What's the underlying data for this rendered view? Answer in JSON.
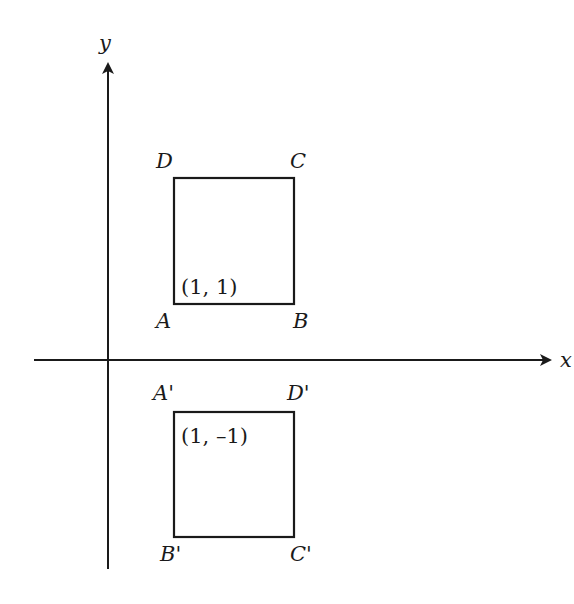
{
  "diagram": {
    "type": "coordinate-reflection",
    "axes": {
      "x_label": "x",
      "y_label": "y",
      "origin_px": [
        108,
        360
      ]
    },
    "original_square": {
      "vertices": {
        "A": "A",
        "B": "B",
        "C": "C",
        "D": "D"
      },
      "corner_coordinate_label": "(1, 1)"
    },
    "reflected_square": {
      "vertices": {
        "A": "A'",
        "B": "B'",
        "C": "C'",
        "D": "D'"
      },
      "corner_coordinate_label": "(1, –1)"
    },
    "colors": {
      "stroke": "#1a1a1a",
      "background": "#ffffff"
    }
  }
}
